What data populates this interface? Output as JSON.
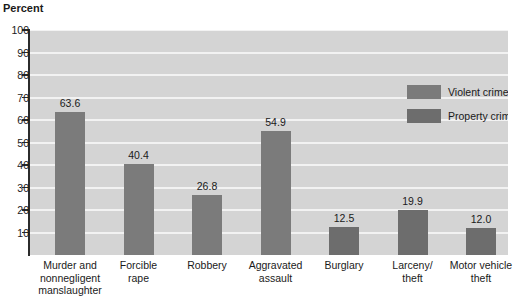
{
  "chart_data": {
    "type": "bar",
    "title": "",
    "subtitle": "",
    "xlabel": "",
    "ylabel": "Percent",
    "ylim": [
      0,
      100
    ],
    "grid": true,
    "legend_position": "upper-right-inside",
    "categories": [
      "Murder and nonnegligent manslaughter",
      "Forcible rape",
      "Robbery",
      "Aggravated assault",
      "Burglary",
      "Larceny/ theft",
      "Motor vehicle theft"
    ],
    "category_lines": [
      [
        "Murder and",
        "nonnegligent",
        "manslaughter"
      ],
      [
        "Forcible",
        "rape"
      ],
      [
        "Robbery"
      ],
      [
        "Aggravated",
        "assault"
      ],
      [
        "Burglary"
      ],
      [
        "Larceny/",
        "theft"
      ],
      [
        "Motor vehicle",
        "theft"
      ]
    ],
    "values": [
      63.6,
      40.4,
      26.8,
      54.9,
      12.5,
      19.9,
      12.0
    ],
    "value_labels": [
      "63.6",
      "40.4",
      "26.8",
      "54.9",
      "12.5",
      "19.9",
      "12.0"
    ],
    "series_of_bar": [
      "violent",
      "violent",
      "violent",
      "violent",
      "property",
      "property",
      "property"
    ],
    "yticks": [
      10,
      20,
      30,
      40,
      50,
      60,
      70,
      80,
      90,
      100
    ],
    "ytick_labels": [
      "10",
      "20",
      "30",
      "40",
      "50",
      "60",
      "70",
      "80",
      "90",
      "100"
    ],
    "legend": [
      {
        "key": "violent",
        "label": "Violent crime",
        "color": "#7b7b7b"
      },
      {
        "key": "property",
        "label": "Property crime",
        "color": "#6d6d6d"
      }
    ],
    "colors": {
      "violent_bar": "#7b7b7b",
      "property_bar": "#6d6d6d",
      "plot_background": "#d4d4d4",
      "gridline": "#f2f2f2",
      "axis": "#2b2b2b",
      "text": "#1a1a1a"
    }
  }
}
